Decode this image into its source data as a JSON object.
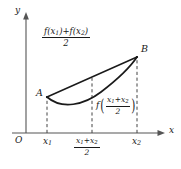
{
  "figure": {
    "kind": "convex-function-jensen-inequality-diagram",
    "axes": {
      "y_label": "y",
      "x_label": "x",
      "origin_label": "O"
    },
    "points": {
      "a_label": "A",
      "b_label": "B"
    },
    "x_ticks": {
      "first": "x",
      "first_sub": "1",
      "second": "x",
      "second_sub": "2"
    },
    "midpoint_tick": {
      "num_left": "x",
      "num_left_sub": "1",
      "num_op": "+",
      "num_right": "x",
      "num_right_sub": "2",
      "den": "2"
    },
    "chord_label": {
      "num_f1": "f(x",
      "num_f1_sub": "1",
      "num_f1_close": ")",
      "num_op": "+",
      "num_f2": "f(x",
      "num_f2_sub": "2",
      "num_f2_close": ")",
      "den": "2"
    },
    "curve_label": {
      "fname": "f",
      "open_paren": "(",
      "close_paren": ")",
      "num_left": "x",
      "num_left_sub": "1",
      "num_op": "+",
      "num_right": "x",
      "num_right_sub": "2",
      "den": "2"
    },
    "colors": {
      "ink": "#1a1a1a",
      "axis": "#555555",
      "dashed": "#555555",
      "background": "#ffffff"
    }
  }
}
